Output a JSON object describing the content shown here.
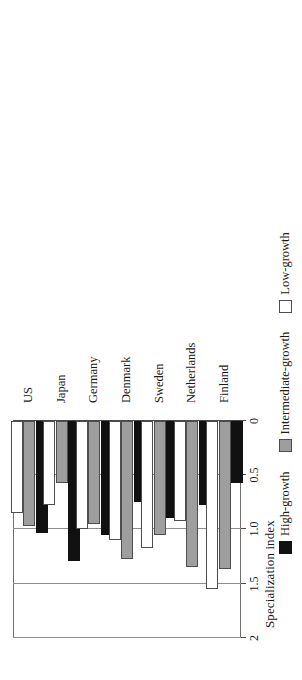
{
  "chart_data": {
    "type": "bar",
    "orientation": "horizontal",
    "title": "",
    "xlabel": "Specialization index",
    "ylabel": "",
    "xlim": [
      0,
      2
    ],
    "xticks": [
      "0",
      "0.5",
      "1.0",
      "1.5",
      "2"
    ],
    "xtick_values": [
      0,
      0.5,
      1.0,
      1.5,
      2.0
    ],
    "grid": true,
    "legend_position": "bottom",
    "categories": [
      "US",
      "Japan",
      "Germany",
      "Denmark",
      "Sweden",
      "Netherlands",
      "Finland"
    ],
    "series": [
      {
        "name": "High-growth",
        "color": "#111111",
        "values": [
          1.03,
          1.29,
          1.05,
          0.75,
          0.89,
          0.77,
          0.57
        ]
      },
      {
        "name": "Intermediate-growth",
        "color": "#9e9e9e",
        "values": [
          0.97,
          0.57,
          0.95,
          1.27,
          1.05,
          1.35,
          1.36
        ]
      },
      {
        "name": "Low-growth",
        "color": "#ffffff",
        "values": [
          0.85,
          0.77,
          1.0,
          1.1,
          1.17,
          0.92,
          1.55
        ]
      }
    ]
  },
  "legend": {
    "entries": [
      {
        "label": "High-growth",
        "swatch": "high"
      },
      {
        "label": "Intermediate-growth",
        "swatch": "inter"
      },
      {
        "label": "Low-growth",
        "swatch": "low"
      }
    ]
  }
}
